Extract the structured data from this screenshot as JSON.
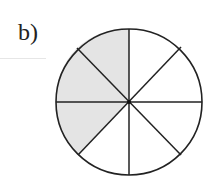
{
  "label": "b)",
  "figure": {
    "type": "circle divided into 8 sectors",
    "total_sectors": 8,
    "shaded_sectors": 3,
    "fraction_shaded": "3/8",
    "colors": {
      "shade": "#e4e4e4",
      "stroke": "#222222",
      "background": "#ffffff"
    }
  }
}
